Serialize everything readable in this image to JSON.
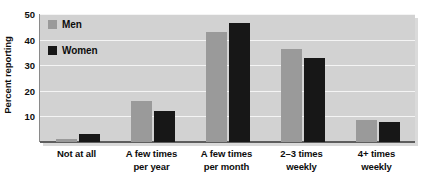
{
  "chart_data": {
    "type": "bar",
    "title": "",
    "subtitle": "",
    "xlabel": "",
    "ylabel": "Percent reporting",
    "ylim": [
      0,
      50
    ],
    "ytick_labels": [
      "10",
      "20",
      "30",
      "40",
      "50"
    ],
    "ytick_values": [
      10,
      20,
      30,
      40,
      50
    ],
    "grid": "horizontal",
    "legend_position": "inside-top-left",
    "categories": [
      "Not at all",
      "A few times per year",
      "A few times per month",
      "2-3 times weekly",
      "4+ times weekly"
    ],
    "category_label_lines": [
      [
        "Not at all"
      ],
      [
        "A few times",
        "per year"
      ],
      [
        "A few times",
        "per month"
      ],
      [
        "2–3 times",
        "weekly"
      ],
      [
        "4+ times",
        "weekly"
      ]
    ],
    "series": [
      {
        "name": "Men",
        "color": "#9a9a9a",
        "values": [
          1,
          16,
          43,
          36.5,
          8.5
        ]
      },
      {
        "name": "Women",
        "color": "#171717",
        "values": [
          3,
          12,
          46.5,
          33,
          8
        ]
      }
    ],
    "annotations": [],
    "plot_background": "#d2d2d2",
    "gridline_color": "#f4f4f4",
    "axis_color": "#5e5e5e"
  }
}
